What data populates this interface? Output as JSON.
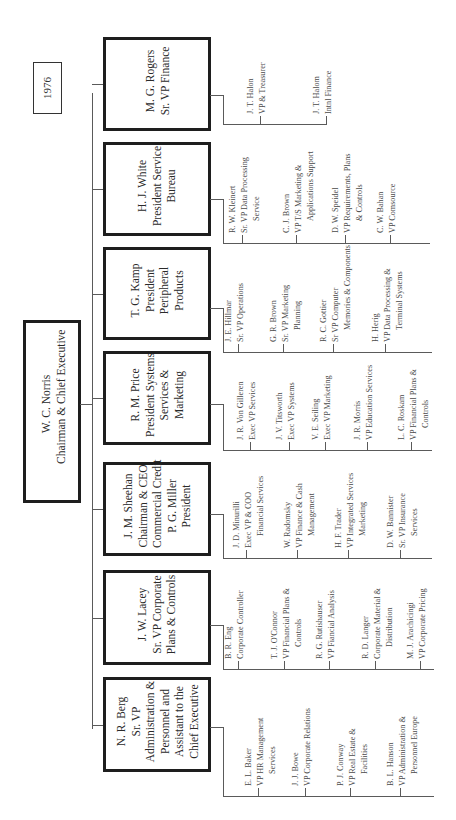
{
  "year_label": "1976",
  "ceo": {
    "name": "W. C. Norris",
    "title": "Chairman & Chief Executive"
  },
  "divisions": [
    {
      "head_lines": [
        "M. G. Rogers",
        "Sr. VP Finance"
      ],
      "reports": [
        {
          "name": "J. T. Halon",
          "title_lines": [
            "VP & Treasurer"
          ]
        },
        {
          "name": "J. T. Halom",
          "title_lines": [
            "Intnl Finance"
          ]
        }
      ]
    },
    {
      "head_lines": [
        "H. J. White",
        "President Service",
        "Bureau"
      ],
      "reports": [
        {
          "name": "R. W. Kleinert",
          "title_lines": [
            "Sr. VP Data Processing",
            "Service"
          ]
        },
        {
          "name": "C. J. Brown",
          "title_lines": [
            "VP T/S Marketing &",
            "Applications Support"
          ]
        },
        {
          "name": "D. W. Speidel",
          "title_lines": [
            "VP Requirements, Plans",
            "& Controls"
          ]
        },
        {
          "name": "C. W. Bahan",
          "title_lines": [
            "VP Comsource"
          ]
        }
      ]
    },
    {
      "head_lines": [
        "T. G. Kamp",
        "President",
        "Peripheral",
        "Products"
      ],
      "reports": [
        {
          "name": "J. E. Hillmar",
          "title_lines": [
            "Sr. VP Operations"
          ]
        },
        {
          "name": "G. R. Brown",
          "title_lines": [
            "Sr. VP Marketing",
            "Planning"
          ]
        },
        {
          "name": "R. C. Gottier",
          "title_lines": [
            "Sr VP Computer",
            "Memories & Components"
          ]
        },
        {
          "name": "H. Herig",
          "title_lines": [
            "VP Data Processing &",
            "Terminal Systems"
          ]
        }
      ]
    },
    {
      "head_lines": [
        "R. M. Price",
        "President Systems",
        "Services &",
        "Marketing"
      ],
      "reports": [
        {
          "name": "J. R. Von Gilleren",
          "title_lines": [
            "Exec VP Services"
          ]
        },
        {
          "name": "J. V. Titsworth",
          "title_lines": [
            "Exec VP Systems"
          ]
        },
        {
          "name": "V. E. Seiling",
          "title_lines": [
            "Exec VP Marketing"
          ]
        },
        {
          "name": "J. R. Morris",
          "title_lines": [
            "VP Education Services"
          ]
        },
        {
          "name": "L. C. Roskam",
          "title_lines": [
            "VP Financial Plans &",
            "Controls"
          ]
        }
      ]
    },
    {
      "head_lines": [
        "J. M. Sheehan",
        "Chairman & CEO",
        "Commercial Credit",
        "P. G. Miller",
        "President"
      ],
      "reports": [
        {
          "name": "J. D. Minurilli",
          "title_lines": [
            "Exec VP & COO",
            "Financial Services"
          ]
        },
        {
          "name": "W. Radomsky",
          "title_lines": [
            "VP Finance & Cash",
            "Management"
          ]
        },
        {
          "name": "H. F. Trader",
          "title_lines": [
            "VP Integrated Services",
            "Marketing"
          ]
        },
        {
          "name": "D. W. Bannister",
          "title_lines": [
            "Sr. VP Insurance",
            "Services"
          ]
        }
      ]
    },
    {
      "head_lines": [
        "J. W. Lacey",
        "Sr. VP Corporate",
        "Plans & Controls"
      ],
      "reports": [
        {
          "name": "B. R. Eng",
          "title_lines": [
            "Corporate Controller"
          ]
        },
        {
          "name": "T. J. O'Connor",
          "title_lines": [
            "VP Financial Plans &",
            "Controls"
          ]
        },
        {
          "name": "R. G. Rutishauser",
          "title_lines": [
            "VP Fiancial Analysis"
          ]
        },
        {
          "name": "R. D. Langer",
          "title_lines": [
            "Corporate Material &",
            "Distribution"
          ]
        },
        {
          "name": "M. J. Arachicingi",
          "title_lines": [
            "VP Corporate Pricing"
          ]
        }
      ]
    },
    {
      "head_lines": [
        "N. R. Berg",
        "Sr. VP",
        "Administration &",
        "Personnel and",
        "Assistant to the",
        "Chief Executive"
      ],
      "reports": [
        {
          "name": "E. L. Baker",
          "title_lines": [
            "VP HR Management",
            "Services"
          ]
        },
        {
          "name": "J. J. Bowe",
          "title_lines": [
            "VP Corporate Relations"
          ]
        },
        {
          "name": "P. J. Conway",
          "title_lines": [
            "VP Real Estate &",
            "Facilities"
          ]
        },
        {
          "name": "B. L. Hanson",
          "title_lines": [
            "VP Administration &",
            "Personnel Europe"
          ]
        }
      ]
    }
  ],
  "layout": {
    "line_color": "#5a5a5a",
    "box_border_color": "#1e1e1e"
  }
}
